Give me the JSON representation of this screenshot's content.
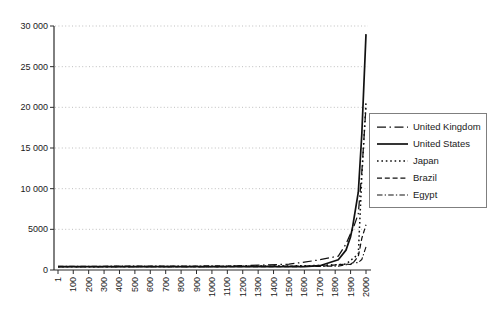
{
  "chart_data": {
    "type": "line",
    "title": "",
    "xlabel": "",
    "ylabel": "",
    "xlim": [
      1,
      2000
    ],
    "ylim": [
      0,
      30000
    ],
    "grid": "horizontal-dotted",
    "legend_position": "right",
    "line_color": "#111111",
    "grid_color": "#b8b8b8",
    "axis_color": "#2b2b2b",
    "x_tick_years": [
      1,
      100,
      200,
      300,
      400,
      500,
      600,
      700,
      800,
      900,
      1000,
      1100,
      1200,
      1300,
      1400,
      1500,
      1600,
      1700,
      1800,
      1900,
      2000
    ],
    "x_tick_labels": [
      "1",
      "100",
      "200",
      "300",
      "400",
      "500",
      "600",
      "700",
      "800",
      "900",
      "1000",
      "1100",
      "1200",
      "1300",
      "1400",
      "1500",
      "1600",
      "1700",
      "1800",
      "1900",
      "2000"
    ],
    "y_ticks": [
      0,
      5000,
      10000,
      15000,
      20000,
      25000,
      30000
    ],
    "y_tick_labels": [
      "0",
      "5000",
      "10 000",
      "15 000",
      "20 000",
      "25 000",
      "30 000"
    ],
    "x": [
      1,
      1000,
      1500,
      1600,
      1700,
      1820,
      1870,
      1900,
      1913,
      1950,
      1973,
      2000
    ],
    "series": [
      {
        "name": "United Kingdom",
        "line_style": "dash-dot",
        "values": [
          400,
          400,
          714,
          974,
          1250,
          1706,
          3190,
          4492,
          4921,
          6939,
          12025,
          20100
        ]
      },
      {
        "name": "United States",
        "line_style": "solid",
        "values": [
          400,
          400,
          400,
          400,
          527,
          1257,
          2445,
          4091,
          5301,
          9561,
          16689,
          29000
        ]
      },
      {
        "name": "Japan",
        "line_style": "dotted",
        "values": [
          400,
          425,
          500,
          520,
          570,
          669,
          737,
          1180,
          1387,
          1926,
          11434,
          20600
        ]
      },
      {
        "name": "Brazil",
        "line_style": "dashed",
        "values": [
          400,
          400,
          400,
          428,
          459,
          646,
          713,
          678,
          811,
          1672,
          3882,
          5560
        ]
      },
      {
        "name": "Egypt",
        "line_style": "dash-dot-fine",
        "values": [
          450,
          500,
          475,
          475,
          475,
          475,
          649,
          700,
          902,
          910,
          1294,
          2850
        ]
      }
    ]
  }
}
